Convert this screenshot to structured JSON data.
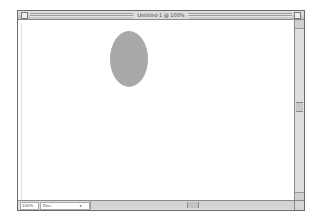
{
  "window": {
    "title": "Untitled-1 @ 100%"
  },
  "canvas": {
    "shapes": [
      {
        "type": "ellipse",
        "fill": "#a9a9a9"
      }
    ]
  },
  "statusbar": {
    "zoom": "100%",
    "doc_info": "Doc:",
    "popup_arrow": "▸"
  },
  "colors": {
    "chrome": "#d8d8d8",
    "ellipse": "#a9a9a9",
    "canvas": "#ffffff"
  }
}
